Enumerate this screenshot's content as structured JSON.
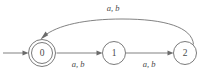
{
  "figure": {
    "kind": "finite-state-automaton",
    "background_color": "#ffffff",
    "stroke_color": "#6b6b6b",
    "text_color": "#4a4a4a"
  },
  "states": [
    {
      "id": "q0",
      "label": "0",
      "accepting": true,
      "start": true,
      "cx": 42,
      "cy": 53,
      "r": 13.5,
      "r_inner": 10.5
    },
    {
      "id": "q1",
      "label": "1",
      "accepting": false,
      "start": false,
      "cx": 114,
      "cy": 53,
      "r": 11.5,
      "r_inner": 0
    },
    {
      "id": "q2",
      "label": "2",
      "accepting": false,
      "start": false,
      "cx": 185,
      "cy": 53,
      "r": 11.5,
      "r_inner": 0
    }
  ],
  "transitions": [
    {
      "id": "t0",
      "from": "q0",
      "to": "q1",
      "label": "a, b",
      "shape": "straight",
      "label_x": 78,
      "label_y": 65
    },
    {
      "id": "t1",
      "from": "q1",
      "to": "q2",
      "label": "a, b",
      "shape": "straight",
      "label_x": 149,
      "label_y": 65
    },
    {
      "id": "t2",
      "from": "q2",
      "to": "q0",
      "label": "a, b",
      "shape": "curved",
      "label_x": 113,
      "label_y": 9
    }
  ],
  "start_arrow": {
    "label": "",
    "x1": 3,
    "y1": 53,
    "x2": 27,
    "y2": 53
  }
}
